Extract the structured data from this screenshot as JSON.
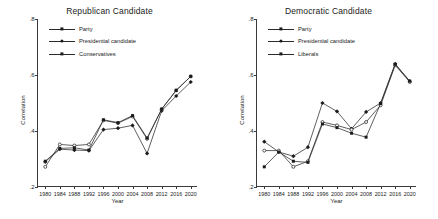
{
  "axis": {
    "ylabel": "Correlation",
    "xlabel": "Year",
    "yticks": [
      ".2",
      ".4",
      ".6",
      ".8"
    ],
    "xticks": [
      "1980",
      "1984",
      "1988",
      "1992",
      "1996",
      "2000",
      "2004",
      "2008",
      "2012",
      "2016",
      "2020"
    ]
  },
  "panels": [
    {
      "title": "Republican Candidate",
      "legend": [
        {
          "label": "Party",
          "marker": "diamond"
        },
        {
          "label": "Presidential candidate",
          "marker": "circle"
        },
        {
          "label": "Conservatives",
          "marker": "square"
        }
      ]
    },
    {
      "title": "Democratic Candidate",
      "legend": [
        {
          "label": "Party",
          "marker": "diamond"
        },
        {
          "label": "Presidential candidate",
          "marker": "circle"
        },
        {
          "label": "Liberals",
          "marker": "square"
        }
      ]
    }
  ],
  "chart_data": [
    {
      "type": "line",
      "title": "Republican Candidate",
      "xlabel": "Year",
      "ylabel": "Correlation",
      "x": [
        1980,
        1984,
        1988,
        1992,
        1996,
        2000,
        2004,
        2008,
        2012,
        2016,
        2020
      ],
      "xlim": [
        1978,
        2022
      ],
      "ylim": [
        0.2,
        0.8
      ],
      "grid": false,
      "legend_position": "top-left",
      "series": [
        {
          "name": "Party",
          "marker": "diamond",
          "values": [
            0.29,
            0.335,
            0.332,
            0.33,
            0.405,
            0.41,
            0.42,
            0.32,
            0.472,
            0.525,
            0.575
          ]
        },
        {
          "name": "Presidential candidate",
          "marker": "circle",
          "values": [
            0.272,
            0.352,
            0.348,
            0.352,
            0.438,
            0.428,
            0.452,
            0.372,
            0.478,
            0.545,
            0.595
          ]
        },
        {
          "name": "Conservatives",
          "marker": "square",
          "values": [
            0.292,
            0.338,
            0.34,
            0.332,
            0.44,
            0.43,
            0.455,
            0.375,
            0.478,
            0.545,
            0.595
          ]
        }
      ]
    },
    {
      "type": "line",
      "title": "Democratic Candidate",
      "xlabel": "Year",
      "ylabel": "Correlation",
      "x": [
        1980,
        1984,
        1988,
        1992,
        1996,
        2000,
        2004,
        2008,
        2012,
        2016,
        2020
      ],
      "xlim": [
        1978,
        2022
      ],
      "ylim": [
        0.2,
        0.8
      ],
      "grid": false,
      "legend_position": "top-left",
      "series": [
        {
          "name": "Party",
          "marker": "diamond",
          "values": [
            0.362,
            0.325,
            0.31,
            0.342,
            0.5,
            0.47,
            0.408,
            0.468,
            0.5,
            0.64,
            0.578
          ]
        },
        {
          "name": "Presidential candidate",
          "marker": "circle",
          "values": [
            0.33,
            0.33,
            0.272,
            0.292,
            0.432,
            0.42,
            0.405,
            0.432,
            0.492,
            0.635,
            0.575
          ]
        },
        {
          "name": "Liberals",
          "marker": "square",
          "values": [
            0.272,
            0.325,
            0.292,
            0.288,
            0.425,
            0.412,
            0.392,
            0.378,
            0.498,
            0.638,
            0.578
          ]
        }
      ]
    }
  ]
}
